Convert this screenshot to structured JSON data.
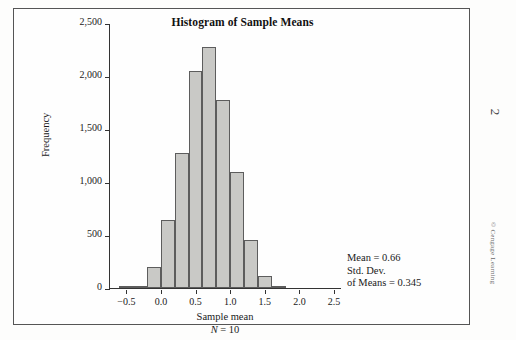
{
  "page": {
    "page_number": "2",
    "copyright": "© Cengage Learning"
  },
  "chart_data": {
    "type": "bar",
    "title": "Histogram of Sample Means",
    "xlabel": "Sample mean",
    "xlabel_sub": "N = 10",
    "ylabel": "Frequency",
    "xlim": [
      -0.75,
      2.6
    ],
    "ylim": [
      0,
      2500
    ],
    "grid": false,
    "legend": null,
    "bin_width": 0.2,
    "bin_starts": [
      -0.6,
      -0.4,
      -0.2,
      0.0,
      0.2,
      0.4,
      0.6,
      0.8,
      1.0,
      1.2,
      1.4,
      1.6
    ],
    "categories": [
      "-0.6",
      "-0.4",
      "-0.2",
      "0.0",
      "0.2",
      "0.4",
      "0.6",
      "0.8",
      "1.0",
      "1.2",
      "1.4",
      "1.6"
    ],
    "values": [
      10,
      20,
      200,
      640,
      1270,
      2050,
      2270,
      1770,
      1090,
      450,
      110,
      20
    ],
    "xticks": [
      -0.5,
      0.0,
      0.5,
      1.0,
      1.5,
      2.0,
      2.5
    ],
    "xtick_labels": [
      "−0.5",
      "0.0",
      "0.5",
      "1.0",
      "1.5",
      "2.0",
      "2.5"
    ],
    "yticks": [
      0,
      500,
      1000,
      1500,
      2000,
      2500
    ],
    "ytick_labels": [
      "0",
      "500",
      "1,000",
      "1,500",
      "2,000",
      "2,500"
    ],
    "annotations": [
      "Mean = 0.66",
      "Std. Dev.",
      "of Means = 0.345"
    ],
    "bar_fill": "#c9c9c6",
    "bar_stroke": "#5d5d5d",
    "axis_color": "#333333"
  }
}
